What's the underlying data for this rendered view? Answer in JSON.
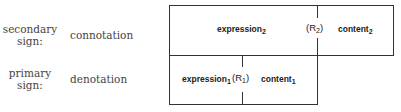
{
  "rows": [
    {
      "sign_label_1": "secondary",
      "sign_label_2": "sign:",
      "term": "connotation"
    },
    {
      "sign_label_1": "primary",
      "sign_label_2": "sign:",
      "term": "denotation"
    }
  ],
  "diagram": {
    "secondary": {
      "expression": "expression",
      "expression_sub": "2",
      "relation": "(R",
      "relation_sub": "2",
      "relation_close": ")",
      "content": "content",
      "content_sub": "2"
    },
    "primary": {
      "expression": "expression",
      "expression_sub": "1",
      "relation": "(R",
      "relation_sub": "1",
      "relation_close": ")",
      "content": "content",
      "content_sub": "1"
    }
  }
}
